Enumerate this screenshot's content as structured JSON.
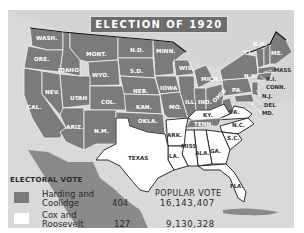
{
  "map": {
    "title": "ELECTION OF 1920",
    "colors": {
      "harding_coolidge": "#7b7b7b",
      "cox_roosevelt": "#ffffff",
      "water_background": "#d9d9d9",
      "title_background": "#6d6d6d"
    },
    "states": {
      "harding_coolidge": [
        "WASH.",
        "ORE.",
        "CAL.",
        "IDAHO",
        "NEV.",
        "MONT.",
        "WYO.",
        "UTAH",
        "ARIZ.",
        "COL.",
        "N.M.",
        "N.D.",
        "S.D.",
        "NEB.",
        "KAN.",
        "OKLA.",
        "MINN.",
        "IOWA",
        "MO.",
        "WIS.",
        "ILL.",
        "MICH.",
        "IND.",
        "OHIO",
        "TENN.",
        "W.VA.",
        "PA.",
        "N.Y.",
        "VT.",
        "N.H.",
        "ME.",
        "MASS.",
        "R.I.",
        "CONN.",
        "N.J.",
        "DEL.",
        "MD."
      ],
      "cox_roosevelt": [
        "TEXAS",
        "ARK.",
        "LA.",
        "MISS.",
        "ALA.",
        "GA.",
        "FLA.",
        "S.C.",
        "N.C.",
        "VA.",
        "KY."
      ]
    },
    "labels": {
      "wash": "WASH.",
      "ore": "ORE.",
      "cal": "CAL.",
      "idaho": "IDAHO",
      "nev": "NEV.",
      "mont": "MONT.",
      "wyo": "WYO.",
      "utah": "UTAH",
      "ariz": "ARIZ.",
      "col": "COL.",
      "nm": "N.M.",
      "nd": "N.D.",
      "sd": "S.D.",
      "neb": "NEB.",
      "kan": "KAN.",
      "okla": "OKLA.",
      "minn": "MINN.",
      "iowa": "IOWA",
      "mo": "MO.",
      "wis": "WIS.",
      "ill": "ILL.",
      "mich": "MICH.",
      "ind": "IND.",
      "ohio": "OHIO",
      "ky": "KY.",
      "tenn": "TENN.",
      "va": "VA.",
      "nc": "N.C.",
      "sc": "S.C.",
      "ga": "GA.",
      "ala": "ALA.",
      "miss": "MISS",
      "ark": "ARK.",
      "la": "LA.",
      "texas": "TEXAS",
      "fla": "FLA.",
      "pa": "PA.",
      "ny": "N.Y.",
      "vt": "VT.",
      "nh": "N.H.",
      "me": "ME.",
      "mass": "MASS",
      "ri": "R.I.",
      "conn": "CONN.",
      "nj": "N.J.",
      "del": "DEL",
      "md": "MD."
    }
  },
  "legend": {
    "electoral_vote_heading": "ELECTORAL VOTE",
    "popular_vote_heading": "POPULAR VOTE",
    "entries": [
      {
        "line1": "Harding and",
        "line2": "Coolidge",
        "electoral_vote": "404",
        "popular_vote": "16,143,407",
        "color": "#7b7b7b"
      },
      {
        "line1": "Cox and",
        "line2": "Roosevelt",
        "electoral_vote": "127",
        "popular_vote": "9,130,328",
        "color": "#ffffff"
      }
    ]
  }
}
